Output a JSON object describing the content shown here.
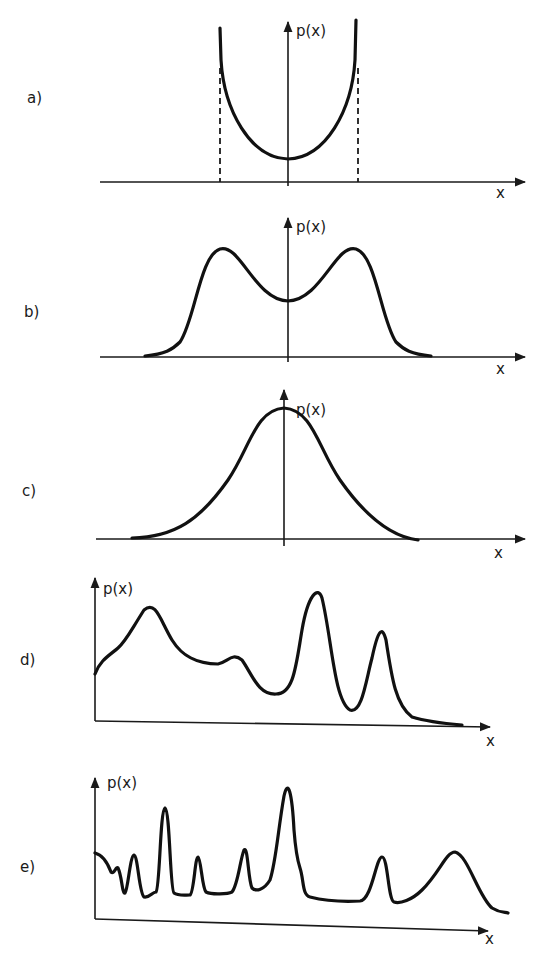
{
  "figure": {
    "panels": [
      {
        "id": "a",
        "label": "a)",
        "y_label": "p(x)",
        "x_label": "x",
        "shape": "U-shaped (arcsine) distribution bounded by dashed verticals"
      },
      {
        "id": "b",
        "label": "b)",
        "y_label": "p(x)",
        "x_label": "x",
        "shape": "symmetric bimodal distribution"
      },
      {
        "id": "c",
        "label": "c)",
        "y_label": "p(x)",
        "x_label": "x",
        "shape": "unimodal bell-shaped (Gaussian-like)"
      },
      {
        "id": "d",
        "label": "d)",
        "y_label": "p(x)",
        "x_label": "x",
        "shape": "multimodal irregular distribution"
      },
      {
        "id": "e",
        "label": "e)",
        "y_label": "p(x)",
        "x_label": "x",
        "shape": "many narrow peaks (spiky multimodal)"
      }
    ]
  },
  "colors": {
    "ink": "#111111",
    "background": "#ffffff"
  }
}
